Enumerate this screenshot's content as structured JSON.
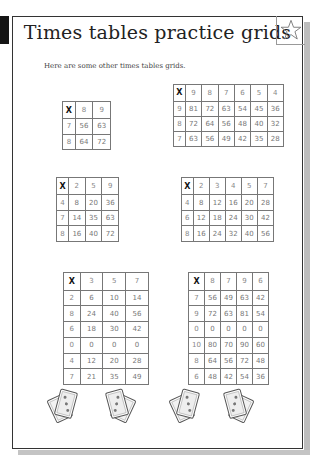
{
  "document": {
    "title": "Times tables practice grids",
    "intro": "Here are some other times tables grids.",
    "star_icon": "star-outline-icon",
    "card_icon": "playing-cards-icon",
    "multiply_symbol": "X"
  },
  "grids": [
    {
      "columns": [
        "9",
        "8",
        "7",
        "6",
        "5",
        "4"
      ],
      "rows": [
        {
          "head": "9",
          "cells": [
            "81",
            "72",
            "63",
            "54",
            "45",
            "36"
          ]
        },
        {
          "head": "8",
          "cells": [
            "72",
            "64",
            "56",
            "48",
            "40",
            "32"
          ]
        },
        {
          "head": "7",
          "cells": [
            "63",
            "56",
            "49",
            "42",
            "35",
            "28"
          ]
        }
      ]
    },
    {
      "columns": [
        "8",
        "9"
      ],
      "rows": [
        {
          "head": "7",
          "cells": [
            "56",
            "63"
          ]
        },
        {
          "head": "8",
          "cells": [
            "64",
            "72"
          ]
        }
      ]
    },
    {
      "columns": [
        "2",
        "5",
        "9"
      ],
      "rows": [
        {
          "head": "4",
          "cells": [
            "8",
            "20",
            "36"
          ]
        },
        {
          "head": "7",
          "cells": [
            "14",
            "35",
            "63"
          ]
        },
        {
          "head": "8",
          "cells": [
            "16",
            "40",
            "72"
          ]
        }
      ]
    },
    {
      "columns": [
        "2",
        "3",
        "4",
        "5",
        "7"
      ],
      "rows": [
        {
          "head": "4",
          "cells": [
            "8",
            "12",
            "16",
            "20",
            "28"
          ]
        },
        {
          "head": "6",
          "cells": [
            "12",
            "18",
            "24",
            "30",
            "42"
          ]
        },
        {
          "head": "8",
          "cells": [
            "16",
            "24",
            "32",
            "40",
            "56"
          ]
        }
      ]
    },
    {
      "columns": [
        "3",
        "5",
        "7"
      ],
      "rows": [
        {
          "head": "2",
          "cells": [
            "6",
            "10",
            "14"
          ]
        },
        {
          "head": "8",
          "cells": [
            "24",
            "40",
            "56"
          ]
        },
        {
          "head": "6",
          "cells": [
            "18",
            "30",
            "42"
          ]
        },
        {
          "head": "0",
          "cells": [
            "0",
            "0",
            "0"
          ]
        },
        {
          "head": "4",
          "cells": [
            "12",
            "20",
            "28"
          ]
        },
        {
          "head": "7",
          "cells": [
            "21",
            "35",
            "49"
          ]
        }
      ]
    },
    {
      "columns": [
        "8",
        "7",
        "9",
        "6"
      ],
      "rows": [
        {
          "head": "7",
          "cells": [
            "56",
            "49",
            "63",
            "42"
          ]
        },
        {
          "head": "9",
          "cells": [
            "72",
            "63",
            "81",
            "54"
          ]
        },
        {
          "head": "0",
          "cells": [
            "0",
            "0",
            "0",
            "0"
          ]
        },
        {
          "head": "10",
          "cells": [
            "80",
            "70",
            "90",
            "60"
          ]
        },
        {
          "head": "8",
          "cells": [
            "64",
            "56",
            "72",
            "48"
          ]
        },
        {
          "head": "6",
          "cells": [
            "48",
            "42",
            "54",
            "36"
          ]
        }
      ]
    }
  ]
}
